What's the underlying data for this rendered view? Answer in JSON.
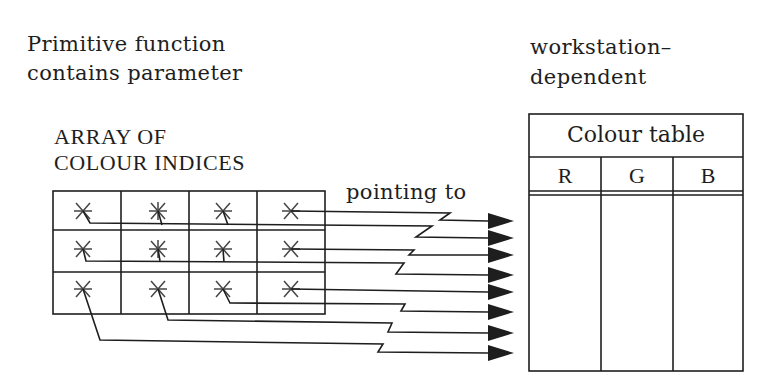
{
  "left_caption": {
    "line1": "Primitive function",
    "line2": "contains parameter"
  },
  "array_label": {
    "line1": "ARRAY OF",
    "line2": "COLOUR INDICES"
  },
  "pointer_label": "pointing to",
  "right_caption": {
    "line1": "workstation–",
    "line2": "dependent"
  },
  "colour_table": {
    "title": "Colour table",
    "columns": [
      "R",
      "G",
      "B"
    ],
    "rows": 8
  },
  "array": {
    "rows": 3,
    "cols": 4,
    "cell_marker": "asterisk",
    "arrow_count": 8
  },
  "colors": {
    "ink": "#1e1e1e",
    "background": "#ffffff"
  }
}
